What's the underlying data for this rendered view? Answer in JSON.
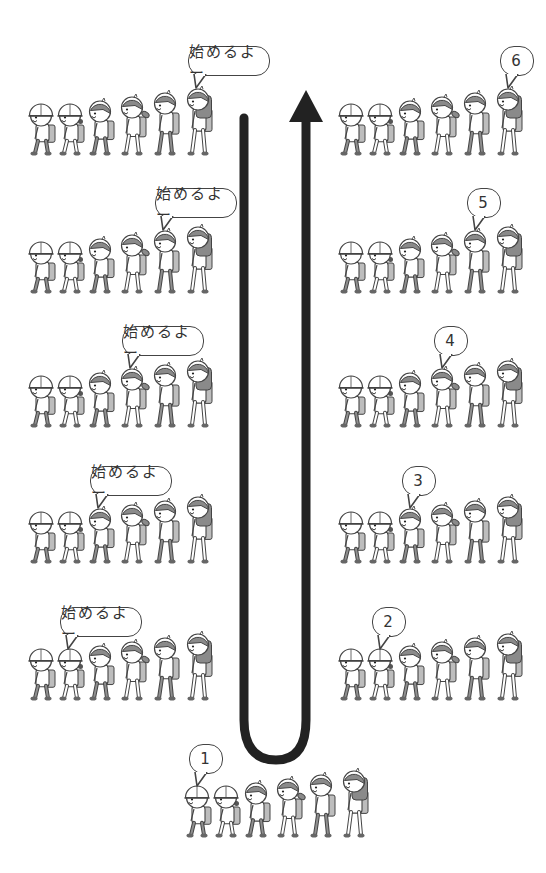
{
  "diagram": {
    "title": "",
    "colors": {
      "arrow": "#222222",
      "outline": "#444444",
      "hair": "#8a8a8a",
      "bag": "#bdbdbd",
      "skin": "#ffffff"
    },
    "arrow": {
      "description": "U-shaped arrow: down the left, around the bottom, up the right, arrowhead at top right"
    },
    "left_column": {
      "rows": [
        {
          "id": "L1",
          "bubble_text": "始めるよー",
          "speaker_index": 6
        },
        {
          "id": "L2",
          "bubble_text": "始めるよー",
          "speaker_index": 5
        },
        {
          "id": "L3",
          "bubble_text": "始めるよー",
          "speaker_index": 4
        },
        {
          "id": "L4",
          "bubble_text": "始めるよー",
          "speaker_index": 3
        },
        {
          "id": "L5",
          "bubble_text": "始めるよー",
          "speaker_index": 2
        }
      ]
    },
    "bottom_row": {
      "bubble_text": "1",
      "speaker_index": 1
    },
    "right_column": {
      "rows": [
        {
          "id": "R2",
          "bubble_text": "2",
          "speaker_index": 2
        },
        {
          "id": "R3",
          "bubble_text": "3",
          "speaker_index": 3
        },
        {
          "id": "R4",
          "bubble_text": "4",
          "speaker_index": 4
        },
        {
          "id": "R5",
          "bubble_text": "5",
          "speaker_index": 5
        },
        {
          "id": "R6",
          "bubble_text": "6",
          "speaker_index": 6
        }
      ]
    },
    "children_per_row": 6,
    "children_order": [
      "small-hat-boy",
      "small-hat-girl",
      "boy",
      "ponytail-girl",
      "tall-boy",
      "tall-girl"
    ]
  }
}
